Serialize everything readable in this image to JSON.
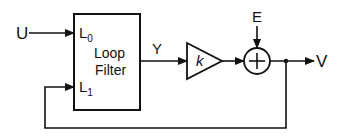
{
  "diagram": {
    "inputs": {
      "u_label": "U",
      "e_label": "E"
    },
    "output": {
      "v_label": "V"
    },
    "loop_filter": {
      "line1": "Loop",
      "line2": "Filter",
      "port0_base": "L",
      "port0_sub": "0",
      "port1_base": "L",
      "port1_sub": "1"
    },
    "signal_y_label": "Y",
    "gain_label": "k",
    "summer_symbol": "+"
  }
}
